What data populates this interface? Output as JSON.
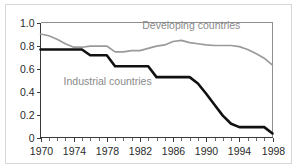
{
  "chart_data": {
    "type": "line",
    "title": "",
    "subtitle": "",
    "xlabel": "",
    "ylabel": "",
    "xlim": [
      1970,
      1998
    ],
    "ylim": [
      0,
      1.0
    ],
    "grid": false,
    "legend_position": "inline-annotation",
    "x": [
      1970,
      1971,
      1972,
      1973,
      1974,
      1975,
      1976,
      1977,
      1978,
      1979,
      1980,
      1981,
      1982,
      1983,
      1984,
      1985,
      1986,
      1987,
      1988,
      1989,
      1990,
      1991,
      1992,
      1993,
      1994,
      1995,
      1996,
      1997,
      1998
    ],
    "y_ticks": [
      "0",
      "0.2",
      "0.4",
      "0.6",
      "0.8",
      "1.0"
    ],
    "y_tick_values": [
      0,
      0.2,
      0.4,
      0.6,
      0.8,
      1.0
    ],
    "x_ticks": [
      "1970",
      "1974",
      "1978",
      "1982",
      "1986",
      "1990",
      "1994",
      "1998"
    ],
    "x_tick_values": [
      1970,
      1974,
      1978,
      1982,
      1986,
      1990,
      1994,
      1998
    ],
    "x_minor_tick_values": [
      1970,
      1971,
      1972,
      1973,
      1974,
      1975,
      1976,
      1977,
      1978,
      1979,
      1980,
      1981,
      1982,
      1983,
      1984,
      1985,
      1986,
      1987,
      1988,
      1989,
      1990,
      1991,
      1992,
      1993,
      1994,
      1995,
      1996,
      1997,
      1998
    ],
    "series": [
      {
        "name": "Developing countries",
        "color": "#9a9a9a",
        "label_x": 1988.2,
        "label_y": 0.945,
        "values": [
          0.9,
          0.885,
          0.855,
          0.815,
          0.785,
          0.785,
          0.795,
          0.795,
          0.795,
          0.745,
          0.745,
          0.755,
          0.755,
          0.775,
          0.795,
          0.805,
          0.835,
          0.845,
          0.825,
          0.815,
          0.805,
          0.8,
          0.8,
          0.8,
          0.79,
          0.765,
          0.73,
          0.69,
          0.63
        ]
      },
      {
        "name": "Industrial countries",
        "color": "#111111",
        "label_x": 1978.1,
        "label_y": 0.455,
        "values": [
          0.765,
          0.765,
          0.765,
          0.765,
          0.765,
          0.765,
          0.715,
          0.715,
          0.715,
          0.62,
          0.62,
          0.62,
          0.62,
          0.62,
          0.525,
          0.525,
          0.525,
          0.525,
          0.525,
          0.47,
          0.38,
          0.285,
          0.19,
          0.12,
          0.09,
          0.09,
          0.09,
          0.09,
          0.035
        ]
      }
    ]
  },
  "axes": {
    "y_axis_name": "y-axis",
    "x_axis_name": "x-axis"
  }
}
